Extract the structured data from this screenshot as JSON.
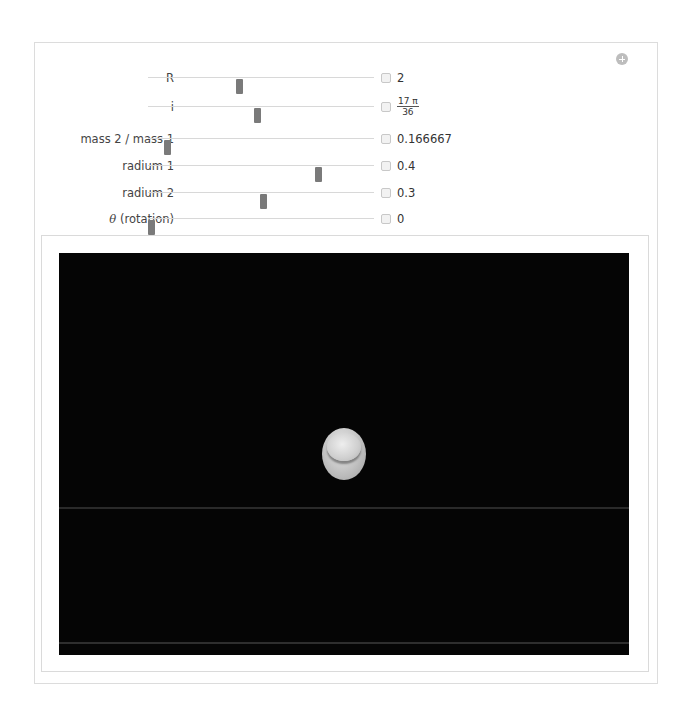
{
  "controls": [
    {
      "label": "R",
      "value": "2",
      "thumb_pos": 0.4
    },
    {
      "label": "i",
      "value_numerator": "17 π",
      "value_denominator": "36",
      "thumb_pos": 0.48
    },
    {
      "label": "mass 2 / mass 1",
      "value": "0.166667",
      "thumb_pos": 0.09
    },
    {
      "label": "radium 1",
      "value": "0.4",
      "thumb_pos": 0.75
    },
    {
      "label": "radium 2",
      "value": "0.3",
      "thumb_pos": 0.51
    },
    {
      "label_symbol": "θ",
      "label_rest": " (rotation)",
      "value": "0",
      "thumb_pos": 0.0
    }
  ],
  "icons": {
    "panel_add": "plus-circle-icon",
    "slider_expand": "plus-square-icon"
  },
  "viewer": {
    "background": "#050505",
    "object": "binary-stars"
  }
}
